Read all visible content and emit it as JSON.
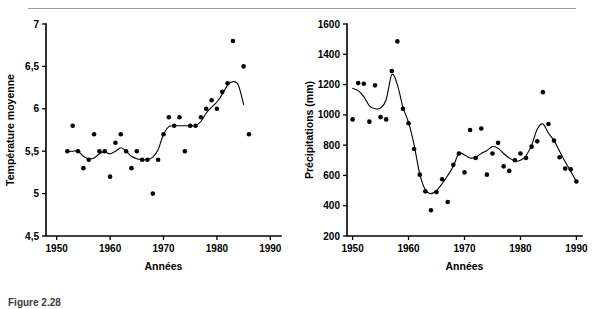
{
  "figure": {
    "caption": "Figure 2.28",
    "rule_color": "#9a9a9a"
  },
  "chart_data": [
    {
      "id": "temperature",
      "type": "scatter",
      "title": "",
      "xlabel": "Années",
      "ylabel": "Température moyenne",
      "xlim": [
        1948,
        1992
      ],
      "ylim": [
        4.5,
        7.0
      ],
      "xticks": [
        1950,
        1960,
        1970,
        1980,
        1990
      ],
      "xticklabels": [
        "1950",
        "1960",
        "1970",
        "1980",
        "1990"
      ],
      "yticks": [
        4.5,
        5,
        5.5,
        6,
        6.5,
        7
      ],
      "yticklabels": [
        "4,5",
        "5",
        "5,5",
        "6",
        "6,5",
        "7"
      ],
      "grid": false,
      "legend": "none",
      "x": [
        1952,
        1953,
        1954,
        1955,
        1956,
        1957,
        1958,
        1959,
        1960,
        1961,
        1962,
        1963,
        1964,
        1965,
        1966,
        1967,
        1968,
        1969,
        1970,
        1971,
        1972,
        1973,
        1974,
        1975,
        1976,
        1977,
        1978,
        1979,
        1980,
        1981,
        1982,
        1983,
        1985,
        1986
      ],
      "y": [
        5.5,
        5.8,
        5.5,
        5.3,
        5.4,
        5.7,
        5.5,
        5.5,
        5.2,
        5.6,
        5.7,
        5.5,
        5.3,
        5.5,
        5.4,
        5.4,
        5.0,
        5.4,
        5.7,
        5.9,
        5.8,
        5.9,
        5.5,
        5.8,
        5.8,
        5.9,
        6.0,
        6.1,
        6.0,
        6.2,
        6.3,
        6.8,
        6.5,
        5.7
      ],
      "series": [
        {
          "name": "Moyenne mobile",
          "x": [
            1952,
            1953,
            1954,
            1955,
            1956,
            1957,
            1958,
            1959,
            1960,
            1961,
            1962,
            1963,
            1964,
            1965,
            1966,
            1967,
            1968,
            1969,
            1970,
            1971,
            1972,
            1973,
            1974,
            1975,
            1976,
            1977,
            1978,
            1979,
            1980,
            1981,
            1982,
            1983,
            1984,
            1985
          ],
          "values": [
            5.5,
            5.5,
            5.5,
            5.44,
            5.41,
            5.42,
            5.47,
            5.49,
            5.47,
            5.5,
            5.54,
            5.5,
            5.44,
            5.41,
            5.4,
            5.4,
            5.43,
            5.52,
            5.7,
            5.79,
            5.8,
            5.8,
            5.8,
            5.8,
            5.8,
            5.85,
            5.95,
            6.02,
            6.08,
            6.17,
            6.28,
            6.32,
            6.28,
            6.05
          ]
        }
      ]
    },
    {
      "id": "precipitations",
      "type": "scatter",
      "title": "",
      "xlabel": "Années",
      "ylabel": "Précipitations (mm)",
      "xlim": [
        1949,
        1991
      ],
      "ylim": [
        200,
        1600
      ],
      "xticks": [
        1950,
        1960,
        1970,
        1980,
        1990
      ],
      "xticklabels": [
        "1950",
        "1960",
        "1970",
        "1980",
        "1990"
      ],
      "yticks": [
        200,
        400,
        600,
        800,
        1000,
        1200,
        1400,
        1600
      ],
      "yticklabels": [
        "200",
        "400",
        "600",
        "800",
        "1000",
        "1200",
        "1400",
        "1600"
      ],
      "grid": false,
      "legend": "none",
      "x": [
        1950,
        1951,
        1952,
        1953,
        1954,
        1955,
        1956,
        1957,
        1958,
        1959,
        1960,
        1961,
        1962,
        1963,
        1964,
        1965,
        1966,
        1967,
        1968,
        1969,
        1970,
        1971,
        1972,
        1973,
        1974,
        1975,
        1976,
        1977,
        1978,
        1979,
        1980,
        1981,
        1982,
        1983,
        1984,
        1985,
        1986,
        1987,
        1988,
        1989,
        1990
      ],
      "y": [
        970,
        1210,
        1205,
        955,
        1195,
        985,
        970,
        1290,
        1485,
        1040,
        945,
        775,
        605,
        495,
        370,
        490,
        575,
        425,
        670,
        745,
        620,
        900,
        715,
        910,
        605,
        745,
        815,
        660,
        630,
        700,
        745,
        715,
        790,
        825,
        1150,
        940,
        830,
        720,
        645,
        640,
        560
      ],
      "series": [
        {
          "name": "Moyenne mobile",
          "x": [
            1950,
            1951,
            1952,
            1953,
            1954,
            1955,
            1956,
            1957,
            1958,
            1959,
            1960,
            1961,
            1962,
            1963,
            1964,
            1965,
            1966,
            1967,
            1968,
            1969,
            1970,
            1971,
            1972,
            1973,
            1974,
            1975,
            1976,
            1977,
            1978,
            1979,
            1980,
            1981,
            1982,
            1983,
            1984,
            1985,
            1986,
            1987,
            1988,
            1989,
            1990
          ],
          "values": [
            1175,
            1160,
            1120,
            1060,
            1040,
            1045,
            1100,
            1265,
            1200,
            1050,
            950,
            800,
            610,
            505,
            480,
            500,
            545,
            600,
            660,
            745,
            735,
            715,
            720,
            745,
            765,
            790,
            780,
            745,
            715,
            695,
            700,
            730,
            800,
            905,
            940,
            880,
            830,
            760,
            690,
            625,
            560
          ]
        }
      ]
    }
  ]
}
